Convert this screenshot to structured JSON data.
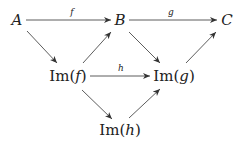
{
  "diagram": {
    "type": "commutative-diagram",
    "nodes": [
      {
        "id": "A",
        "label": "A",
        "x": 17,
        "y": 20
      },
      {
        "id": "B",
        "label": "B",
        "x": 120,
        "y": 20
      },
      {
        "id": "C",
        "label": "C",
        "x": 227,
        "y": 20
      },
      {
        "id": "Imf",
        "label_prefix": "Im(",
        "arg": "f",
        "label_suffix": ")",
        "x": 68,
        "y": 76
      },
      {
        "id": "Img",
        "label_prefix": "Im(",
        "arg": "g",
        "label_suffix": ")",
        "x": 174,
        "y": 76
      },
      {
        "id": "Imh",
        "label_prefix": "Im(",
        "arg": "h",
        "label_suffix": ")",
        "x": 120,
        "y": 130
      }
    ],
    "edges": [
      {
        "from": "A",
        "to": "B",
        "label": "f"
      },
      {
        "from": "B",
        "to": "C",
        "label": "g"
      },
      {
        "from": "Imf",
        "to": "Img",
        "label": "h"
      },
      {
        "from": "A",
        "to": "Imf",
        "label": ""
      },
      {
        "from": "Imf",
        "to": "B",
        "label": ""
      },
      {
        "from": "B",
        "to": "Img",
        "label": ""
      },
      {
        "from": "Img",
        "to": "C",
        "label": ""
      },
      {
        "from": "Imf",
        "to": "Imh",
        "label": ""
      },
      {
        "from": "Imh",
        "to": "Img",
        "label": ""
      }
    ]
  }
}
